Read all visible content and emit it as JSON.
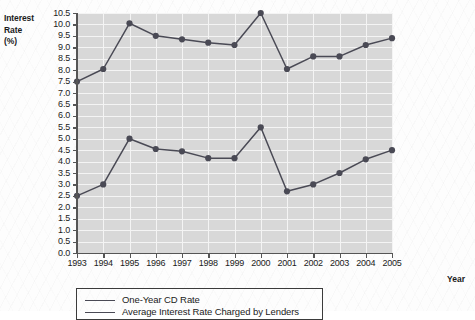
{
  "axes": {
    "y_title_lines": [
      "Interest",
      "Rate",
      "(%)"
    ],
    "x_title": "Year"
  },
  "legend": {
    "series": [
      {
        "label": "One-Year CD Rate",
        "color": "#4a4a55"
      },
      {
        "label": "Average Interest Rate Charged by Lenders",
        "color": "#4a4a55"
      }
    ]
  },
  "chart_data": {
    "type": "line",
    "title": "",
    "xlabel": "Year",
    "ylabel": "Interest Rate (%)",
    "xlim": [
      1993,
      2005
    ],
    "ylim": [
      0.0,
      10.5
    ],
    "ytick_step": 0.5,
    "grid": true,
    "legend_position": "bottom-left",
    "categories": [
      1993,
      1994,
      1995,
      1996,
      1997,
      1998,
      1999,
      2000,
      2001,
      2002,
      2003,
      2004,
      2005
    ],
    "ytick_labels": [
      "0.0",
      "0.5",
      "1.0",
      "1.5",
      "2.0",
      "2.5",
      "3.0",
      "3.5",
      "4.0",
      "4.5",
      "5.0",
      "5.5",
      "6.0",
      "6.5",
      "7.0",
      "7.5",
      "8.0",
      "8.5",
      "9.0",
      "9.5",
      "10.0",
      "10.5"
    ],
    "xtick_labels": [
      "1993",
      "1994",
      "1995",
      "1996",
      "1997",
      "1998",
      "1999",
      "2000",
      "2001",
      "2002",
      "2003",
      "2004",
      "2005"
    ],
    "series": [
      {
        "name": "Average Interest Rate Charged by Lenders",
        "color": "#4a4a55",
        "values": [
          7.5,
          8.05,
          10.05,
          9.5,
          9.35,
          9.2,
          9.1,
          10.5,
          8.05,
          8.6,
          8.6,
          9.1,
          9.4
        ]
      },
      {
        "name": "One-Year CD Rate",
        "color": "#4a4a55",
        "values": [
          2.5,
          3.0,
          5.0,
          4.55,
          4.45,
          4.15,
          4.15,
          5.5,
          2.7,
          3.0,
          3.5,
          4.1,
          4.5
        ]
      }
    ]
  }
}
